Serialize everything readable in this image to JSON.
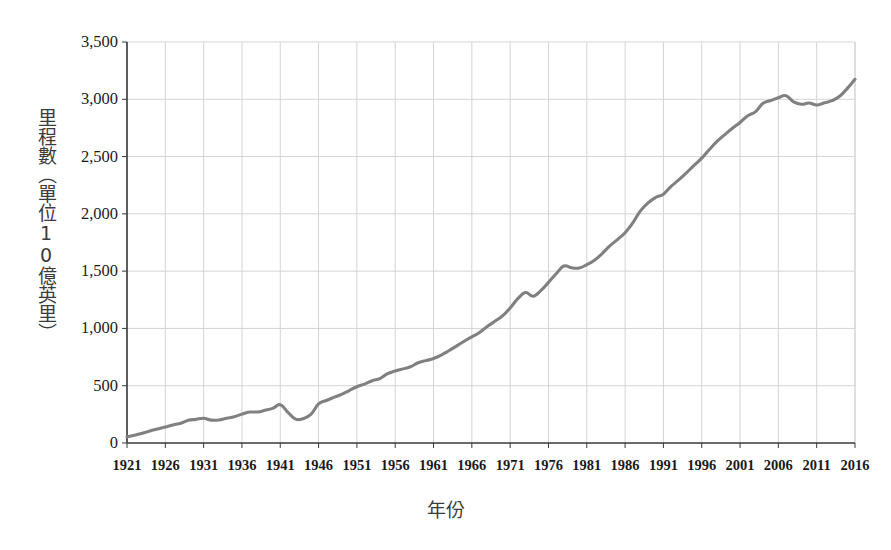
{
  "chart_data": {
    "type": "line",
    "title": "",
    "xlabel": "年份",
    "ylabel": "里程數（單位10億英里）",
    "xlim": [
      1921,
      2016
    ],
    "ylim": [
      0,
      3500
    ],
    "grid": true,
    "legend": false,
    "line_color": "#808080",
    "grid_color": "#d4d4d4",
    "axis_color": "#3a3a3a",
    "x_tick_labels": [
      "1921",
      "1926",
      "1931",
      "1936",
      "1941",
      "1946",
      "1951",
      "1956",
      "1961",
      "1966",
      "1971",
      "1976",
      "1981",
      "1986",
      "1991",
      "1996",
      "2001",
      "2006",
      "2011",
      "2016"
    ],
    "y_tick_labels": [
      "0",
      "500",
      "1,000",
      "1,500",
      "2,000",
      "2,500",
      "3,000",
      "3,500"
    ],
    "y_tick_values": [
      0,
      500,
      1000,
      1500,
      2000,
      2500,
      3000,
      3500
    ],
    "x": [
      1921,
      1922,
      1923,
      1924,
      1925,
      1926,
      1927,
      1928,
      1929,
      1930,
      1931,
      1932,
      1933,
      1934,
      1935,
      1936,
      1937,
      1938,
      1939,
      1940,
      1941,
      1942,
      1943,
      1944,
      1945,
      1946,
      1947,
      1948,
      1949,
      1950,
      1951,
      1952,
      1953,
      1954,
      1955,
      1956,
      1957,
      1958,
      1959,
      1960,
      1961,
      1962,
      1963,
      1964,
      1965,
      1966,
      1967,
      1968,
      1969,
      1970,
      1971,
      1972,
      1973,
      1974,
      1975,
      1976,
      1977,
      1978,
      1979,
      1980,
      1981,
      1982,
      1983,
      1984,
      1985,
      1986,
      1987,
      1988,
      1989,
      1990,
      1991,
      1992,
      1993,
      1994,
      1995,
      1996,
      1997,
      1998,
      1999,
      2000,
      2001,
      2002,
      2003,
      2004,
      2005,
      2006,
      2007,
      2008,
      2009,
      2010,
      2011,
      2012,
      2013,
      2014,
      2015,
      2016
    ],
    "values": [
      55,
      67,
      85,
      105,
      122,
      140,
      158,
      172,
      198,
      206,
      216,
      200,
      201,
      216,
      229,
      252,
      270,
      271,
      285,
      302,
      334,
      268,
      208,
      213,
      250,
      341,
      371,
      398,
      424,
      458,
      491,
      514,
      544,
      562,
      605,
      628,
      647,
      665,
      700,
      719,
      738,
      767,
      805,
      846,
      888,
      926,
      965,
      1016,
      1062,
      1110,
      1179,
      1260,
      1313,
      1281,
      1330,
      1402,
      1477,
      1545,
      1529,
      1527,
      1556,
      1595,
      1653,
      1720,
      1775,
      1835,
      1921,
      2026,
      2096,
      2144,
      2172,
      2240,
      2296,
      2358,
      2423,
      2486,
      2562,
      2632,
      2691,
      2747,
      2797,
      2856,
      2890,
      2965,
      2989,
      3014,
      3031,
      2977,
      2957,
      2967,
      2950,
      2969,
      2988,
      3026,
      3095,
      3174
    ],
    "annotations": []
  },
  "axis": {
    "y_title": "里程數（單位10億英里）",
    "x_title": "年份"
  }
}
